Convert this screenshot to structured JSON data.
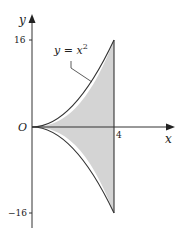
{
  "diagram": {
    "type": "region-between-curves",
    "axes": {
      "x_label": "x",
      "y_label": "y",
      "origin_label": "O",
      "x_ticks": [
        "4"
      ],
      "y_ticks": [
        "16",
        "−16"
      ]
    },
    "curve_label": {
      "text_base": "y = x",
      "superscript": "2"
    },
    "curves": [
      {
        "name": "upper",
        "equation": "y = x^2",
        "domain": [
          0,
          4
        ]
      },
      {
        "name": "lower",
        "equation": "y = -x^2",
        "domain": [
          0,
          4
        ]
      }
    ],
    "boundary": {
      "x": 4
    },
    "colors": {
      "fill": "#d4d4d4",
      "stroke": "#333333",
      "axis": "#333333"
    }
  }
}
